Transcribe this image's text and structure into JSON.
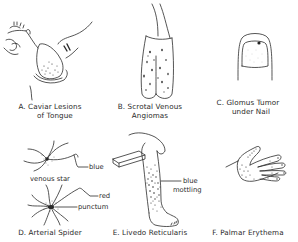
{
  "figure": {
    "panels": [
      {
        "id": "A",
        "caption_line1": "A. Caviar Lesions",
        "caption_line2": "of Tongue",
        "icon": "tongue-illustration"
      },
      {
        "id": "B",
        "caption_line1": "B. Scrotal Venous",
        "caption_line2": "Angiomas",
        "icon": "scrotum-illustration"
      },
      {
        "id": "C",
        "caption_line1": "C. Glomus Tumor",
        "caption_line2": "under Nail",
        "icon": "fingernail-illustration"
      },
      {
        "id": "D",
        "caption_line1": "D. Arterial Spider",
        "caption_line2": "",
        "icon": "spider-angioma-illustration",
        "labels": {
          "blue": "blue",
          "venous_star": "venous star",
          "red": "red",
          "punctum": "punctum"
        }
      },
      {
        "id": "E",
        "caption_line1": "E. Livedo Reticularis",
        "caption_line2": "",
        "icon": "leg-illustration",
        "labels": {
          "blue": "blue",
          "mottling": "mottling"
        }
      },
      {
        "id": "F",
        "caption_line1": "F. Palmar Erythema",
        "caption_line2": "",
        "icon": "hand-illustration"
      }
    ]
  }
}
